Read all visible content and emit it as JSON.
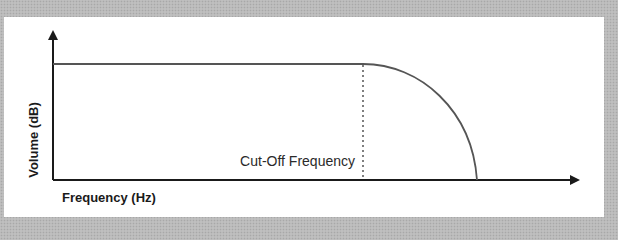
{
  "diagram": {
    "x_axis_label": "Frequency (Hz)",
    "y_axis_label": "Volume (dB)",
    "annotation": "Cut-Off Frequency",
    "colors": {
      "axis": "#1a1a1a",
      "curve": "#555555",
      "dashed": "#555555",
      "panel": "#ffffff",
      "frame": "#b9b9b9"
    }
  }
}
